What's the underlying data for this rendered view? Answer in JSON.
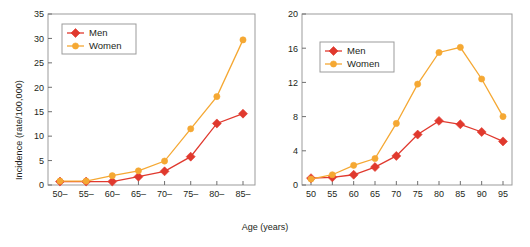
{
  "figure": {
    "xlabel": "Age (years)",
    "colors": {
      "men": "#e0392e",
      "women": "#f5a833",
      "frame": "#9b9b9b",
      "text": "#231f20",
      "background": "#ffffff"
    }
  },
  "chart_data": [
    {
      "type": "line",
      "panel": "left",
      "title": "",
      "xlabel": "Age (years)",
      "ylabel": "Incidence (rate/100,000)",
      "categories": [
        "50–",
        "55–",
        "60–",
        "65–",
        "70–",
        "75–",
        "80–",
        "85–"
      ],
      "x": [
        50,
        55,
        60,
        65,
        70,
        75,
        80,
        85
      ],
      "ylim": [
        0,
        35
      ],
      "yticks": [
        0,
        5,
        10,
        15,
        20,
        25,
        30,
        35
      ],
      "ytick_labels": [
        "0",
        "5",
        "10",
        "15",
        "20",
        "25",
        "30",
        "35"
      ],
      "grid": false,
      "legend_position": "upper left",
      "series": [
        {
          "name": "Men",
          "color": "#e0392e",
          "marker": "diamond",
          "values": [
            0.7,
            0.7,
            0.7,
            1.7,
            2.8,
            5.8,
            12.6,
            14.6
          ]
        },
        {
          "name": "Women",
          "color": "#f5a833",
          "marker": "circle",
          "values": [
            0.8,
            0.8,
            1.9,
            2.9,
            4.9,
            11.5,
            18.1,
            29.7
          ]
        }
      ]
    },
    {
      "type": "line",
      "panel": "right",
      "title": "",
      "xlabel": "Age (years)",
      "ylabel": "Probability (%)",
      "categories": [
        "50",
        "55",
        "60",
        "65",
        "70",
        "75",
        "80",
        "85",
        "90",
        "95"
      ],
      "x": [
        50,
        55,
        60,
        65,
        70,
        75,
        80,
        85,
        90,
        95
      ],
      "ylim": [
        0,
        20
      ],
      "yticks": [
        0,
        4,
        8,
        12,
        16,
        20
      ],
      "ytick_labels": [
        "0",
        "4",
        "8",
        "12",
        "16",
        "20"
      ],
      "grid": false,
      "legend_position": "upper left",
      "series": [
        {
          "name": "Men",
          "color": "#e0392e",
          "marker": "diamond",
          "values": [
            0.8,
            0.9,
            1.2,
            2.1,
            3.4,
            5.9,
            7.5,
            7.1,
            6.2,
            5.1
          ]
        },
        {
          "name": "Women",
          "color": "#f5a833",
          "marker": "circle",
          "values": [
            0.7,
            1.2,
            2.3,
            3.1,
            7.2,
            11.8,
            15.5,
            16.1,
            12.4,
            8.0
          ]
        }
      ]
    }
  ]
}
